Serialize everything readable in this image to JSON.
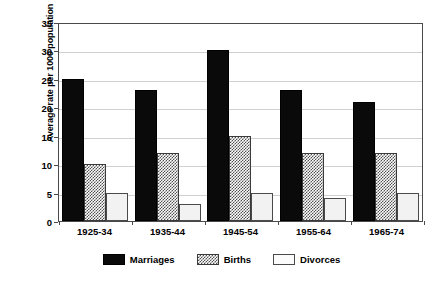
{
  "chart_data": {
    "type": "bar",
    "title": "",
    "subtitle": "",
    "xlabel": "",
    "ylabel": "Average rate per 1000 population",
    "categories": [
      "1925-34",
      "1935-44",
      "1945-54",
      "1955-64",
      "1965-74"
    ],
    "series": [
      {
        "name": "Marriages",
        "values": [
          25,
          23,
          30,
          23,
          21
        ],
        "fill": "solid-black",
        "color": "#0a0a0a"
      },
      {
        "name": "Births",
        "values": [
          10,
          12,
          15,
          12,
          12
        ],
        "fill": "cross-hatch",
        "color": "#4f4f4f"
      },
      {
        "name": "Divorces",
        "values": [
          5,
          3,
          5,
          4,
          5
        ],
        "fill": "light-solid",
        "color": "#f2f2f2"
      }
    ],
    "ylim": [
      0,
      35
    ],
    "yticks": [
      0,
      5,
      10,
      15,
      20,
      25,
      30,
      35
    ],
    "ytick_labels": [
      "0",
      "5",
      "10",
      "15",
      "20",
      "25",
      "30",
      "35"
    ],
    "grid": "horizontal",
    "legend_position": "bottom-center",
    "frame": "box"
  },
  "axis": {
    "y_title": "Average rate per 1000 population"
  },
  "legend": {
    "items": [
      {
        "label": "Marriages"
      },
      {
        "label": "Births"
      },
      {
        "label": "Divorces"
      }
    ]
  }
}
